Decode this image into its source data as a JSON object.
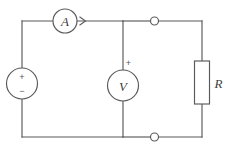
{
  "diagram": {
    "background_color": "#ffffff",
    "line_color": "#59595b",
    "text_color": "#3f3f41"
  },
  "components": {
    "source": {
      "name": "voltage-source",
      "symbol": "circle",
      "plus_sign": "+",
      "minus_sign": "−"
    },
    "ammeter": {
      "name": "ammeter",
      "label": "A",
      "symbol": "circle",
      "current_arrow": "right"
    },
    "voltmeter": {
      "name": "voltmeter",
      "label": "V",
      "symbol": "circle",
      "plus_sign": "+"
    },
    "resistor": {
      "name": "resistor",
      "label": "R",
      "symbol": "rectangle"
    },
    "terminals": {
      "top": "open-terminal",
      "bottom": "open-terminal"
    }
  },
  "icons": {
    "arrow_right": "arrow-right-icon",
    "terminal_node": "terminal-node-icon"
  }
}
